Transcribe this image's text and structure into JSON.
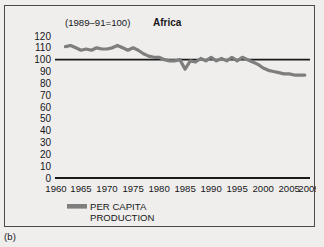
{
  "figure": {
    "panel_label": "(b)",
    "background_color": "#efeeec",
    "frame_color": "#4a4a4a"
  },
  "chart_data": {
    "type": "line",
    "title": "Africa",
    "subtitle": "(1989–91=100)",
    "xlabel": "",
    "ylabel": "",
    "xlim": [
      1960,
      2009
    ],
    "ylim": [
      0,
      120
    ],
    "ytick_step": 10,
    "grid": false,
    "legend_position": "bottom-left",
    "reference_line": {
      "value": 100,
      "color": "#1a1a1a",
      "label": "index base (1989-91 = 100)"
    },
    "series": [
      {
        "name": "PER CAPITA PRODUCTION",
        "color": "#7e7e7e",
        "line_width": 3.2,
        "x": [
          1962,
          1963,
          1964,
          1965,
          1966,
          1967,
          1968,
          1969,
          1970,
          1971,
          1972,
          1973,
          1974,
          1975,
          1976,
          1977,
          1978,
          1979,
          1980,
          1981,
          1982,
          1983,
          1984,
          1985,
          1986,
          1987,
          1988,
          1989,
          1990,
          1991,
          1992,
          1993,
          1994,
          1995,
          1996,
          1997,
          1998,
          1999,
          2000,
          2001,
          2002,
          2003,
          2004,
          2005,
          2006,
          2007,
          2008
        ],
        "values": [
          111,
          112,
          110,
          108,
          109,
          108,
          110,
          109,
          109,
          110,
          112,
          110,
          108,
          110,
          108,
          105,
          103,
          102,
          102,
          100,
          99,
          99,
          100,
          92,
          99,
          98,
          101,
          99,
          102,
          99,
          101,
          99,
          102,
          99,
          102,
          100,
          98,
          96,
          93,
          91,
          90,
          89,
          88,
          88,
          87,
          87,
          87
        ]
      }
    ],
    "xticks": [
      1960,
      1965,
      1970,
      1975,
      1980,
      1985,
      1990,
      1995,
      2000,
      2005,
      2009
    ],
    "yticks": [
      0,
      10,
      20,
      30,
      40,
      50,
      60,
      70,
      80,
      90,
      100,
      110,
      120
    ]
  },
  "legend": {
    "entries": [
      {
        "label_line1": "PER CAPITA",
        "label_line2": "PRODUCTION",
        "swatch_color": "#7e7e7e"
      }
    ]
  }
}
